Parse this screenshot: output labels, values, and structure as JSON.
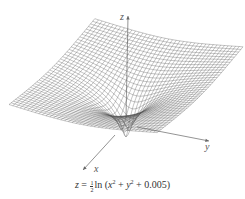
{
  "figure": {
    "type": "3d-surface-plot",
    "axes": {
      "z_label": "z",
      "y_label": "y",
      "x_label": "x"
    },
    "caption": {
      "lhs": "z",
      "equals": "=",
      "frac_num": "1",
      "frac_den": "2",
      "func": "ln",
      "arg_open": "(",
      "x_term": "x",
      "x_exp": "2",
      "plus1": " + ",
      "y_term": "y",
      "y_exp": "2",
      "plus2": " + 0.005)"
    },
    "colors": {
      "mesh": "#555555",
      "axis": "#666666",
      "background": "#ffffff"
    }
  }
}
